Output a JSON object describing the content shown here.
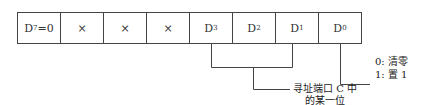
{
  "register": {
    "cells": [
      {
        "base": "D",
        "sub": "7",
        "suffix": "=0"
      },
      {
        "base": "×",
        "sub": "",
        "suffix": ""
      },
      {
        "base": "×",
        "sub": "",
        "suffix": ""
      },
      {
        "base": "×",
        "sub": "",
        "suffix": ""
      },
      {
        "base": "D",
        "sub": "3",
        "suffix": ""
      },
      {
        "base": "D",
        "sub": "2",
        "suffix": ""
      },
      {
        "base": "D",
        "sub": "1",
        "suffix": ""
      },
      {
        "base": "D",
        "sub": "0",
        "suffix": ""
      }
    ]
  },
  "annotations": {
    "d0_line1": "0: 清零",
    "d0_line2": "1: 置 1",
    "bits_line1": "寻址端口 C 中",
    "bits_line2": "的某一位"
  },
  "colors": {
    "line": "#444444",
    "text": "#222222"
  }
}
